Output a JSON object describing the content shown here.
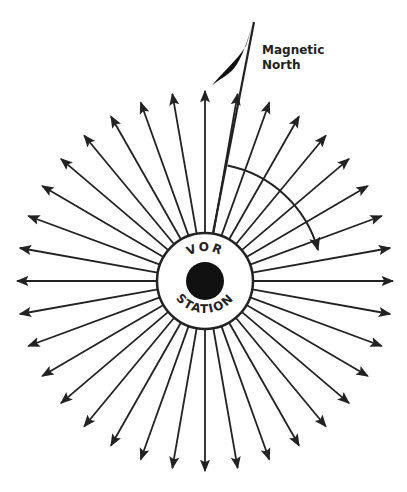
{
  "diagram": {
    "station_label_top": "VOR",
    "station_label_bottom": "STATION",
    "magnetic_north_line1": "Magnetic",
    "magnetic_north_line2": "North",
    "radial_count": 36,
    "radial_spacing_deg": 10,
    "colors": {
      "ink": "#222222",
      "background": "#ffffff"
    }
  }
}
